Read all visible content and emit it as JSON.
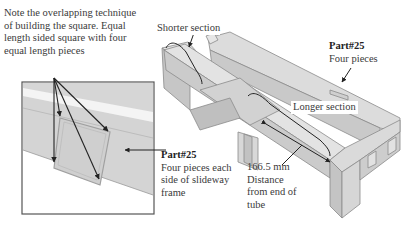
{
  "figure": {
    "inset_note": {
      "lines": [
        "Note the overlapping technique",
        "of building the square. Equal",
        "length sided square with four",
        "equal length pieces"
      ]
    },
    "labels": {
      "shorter_section": "Shorter section",
      "longer_section": "Longer section",
      "part_top": {
        "title": "Part#25",
        "desc": "Four pieces"
      },
      "part_bottom": {
        "title": "Part#25",
        "lines": [
          "Four pieces each",
          "side of slideway",
          "frame"
        ]
      },
      "distance": {
        "lines": [
          "166.5 mm",
          "Distance",
          "from end of",
          "tube"
        ]
      }
    },
    "colors": {
      "frame_fill": "#d9d9d9",
      "frame_light": "#e8e8e8",
      "frame_dark": "#bdbdbd",
      "edge": "#8a8a8a",
      "arrow": "#222222"
    }
  }
}
